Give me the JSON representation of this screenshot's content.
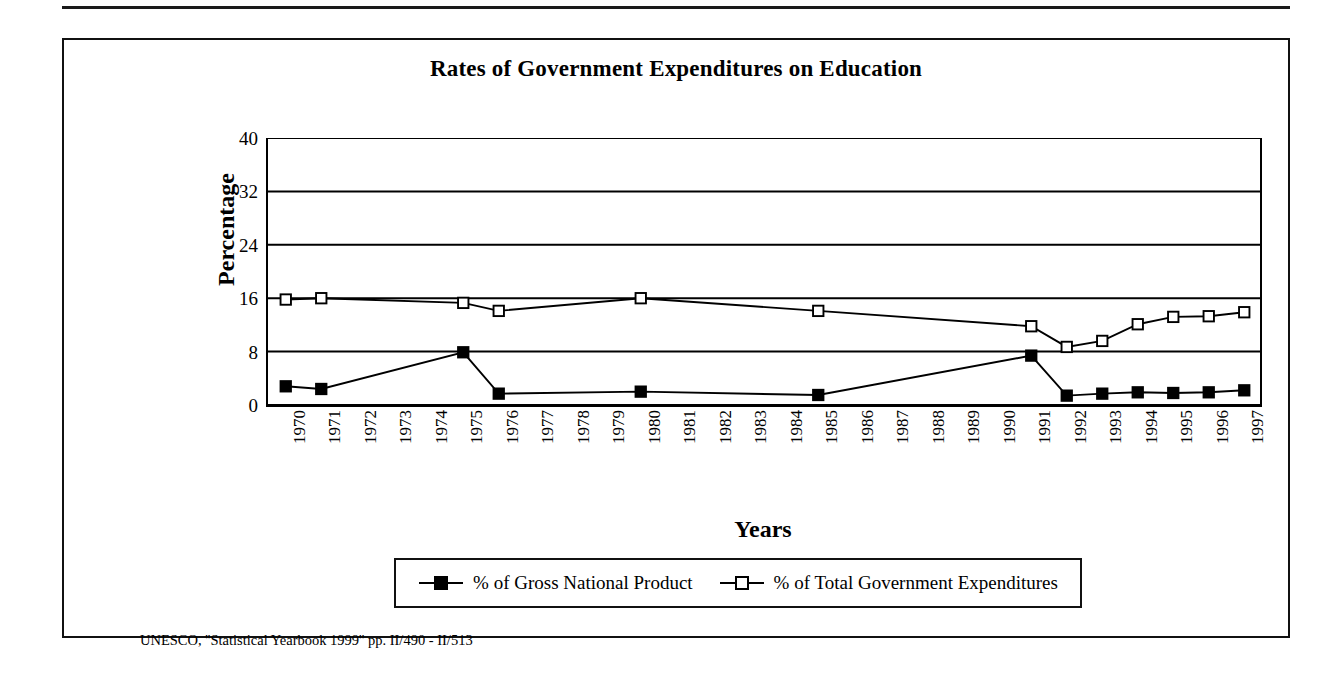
{
  "figure": {
    "title": "Rates of Government Expenditures on Education",
    "source_note": "UNESCO, ''Statistical Yearbook 1999'' pp. II/490 - II/513"
  },
  "axes": {
    "y_label": "Percentage",
    "x_label": "Years",
    "y_ticks": [
      "0",
      "8",
      "16",
      "24",
      "32",
      "40"
    ]
  },
  "legend": {
    "items": [
      {
        "label": "% of Gross National Product",
        "marker": "filled-square",
        "color": "#000000"
      },
      {
        "label": "% of Total Government Expenditures",
        "marker": "open-square",
        "color": "#000000"
      }
    ]
  },
  "chart_data": {
    "type": "line",
    "title": "Rates of Government Expenditures on Education",
    "xlabel": "Years",
    "ylabel": "Percentage",
    "ylim": [
      0,
      40
    ],
    "yticks": [
      0,
      8,
      16,
      24,
      32,
      40
    ],
    "grid": true,
    "legend_position": "bottom",
    "categories": [
      "1970",
      "1971",
      "1972",
      "1973",
      "1974",
      "1975",
      "1976",
      "1977",
      "1978",
      "1979",
      "1980",
      "1981",
      "1982",
      "1983",
      "1984",
      "1985",
      "1986",
      "1987",
      "1988",
      "1989",
      "1990",
      "1991",
      "1992",
      "1993",
      "1994",
      "1995",
      "1996",
      "1997"
    ],
    "series": [
      {
        "name": "% of Gross National Product",
        "marker": "filled-square",
        "color": "#000000",
        "values": [
          2.8,
          2.4,
          null,
          null,
          null,
          7.9,
          1.7,
          null,
          null,
          null,
          2.0,
          null,
          null,
          null,
          null,
          1.5,
          null,
          null,
          null,
          null,
          null,
          7.4,
          1.4,
          1.7,
          1.9,
          1.8,
          1.9,
          2.2
        ]
      },
      {
        "name": "% of Total Government Expenditures",
        "marker": "open-square",
        "color": "#000000",
        "values": [
          15.8,
          16.0,
          null,
          null,
          null,
          15.3,
          14.1,
          null,
          null,
          null,
          16.0,
          null,
          null,
          null,
          null,
          14.1,
          null,
          null,
          null,
          null,
          null,
          11.8,
          8.7,
          9.6,
          12.1,
          13.2,
          13.3,
          13.9
        ]
      }
    ]
  }
}
